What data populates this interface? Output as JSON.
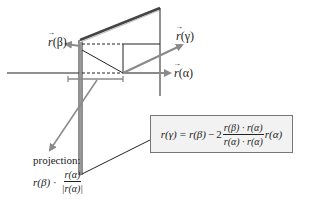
{
  "diagram": {
    "type": "reflection-geometry",
    "colors": {
      "line": "#222222",
      "vector_arrow": "#8a8a8a",
      "panel_edge": "#555555",
      "formula_bg": "#f2f2f2",
      "formula_border": "#777777"
    }
  },
  "labels": {
    "r_beta": {
      "vec": "r",
      "arg": "(β)"
    },
    "r_gamma": {
      "vec": "r",
      "arg": "(γ)"
    },
    "r_alpha": {
      "vec": "r",
      "arg": "(α)"
    }
  },
  "projection": {
    "title": "projection:",
    "lhs": "r(β)",
    "dot": "·",
    "numerator": "r(α)",
    "denominator": "|r(α)|"
  },
  "formula": {
    "lhs": "r(γ)",
    "equals": "=",
    "term1": "r(β)",
    "minus": "−",
    "coefficient": "2",
    "numerator": "r(β) · r(α)",
    "denominator": "r(α) · r(α)",
    "trailing": "r(α)"
  }
}
